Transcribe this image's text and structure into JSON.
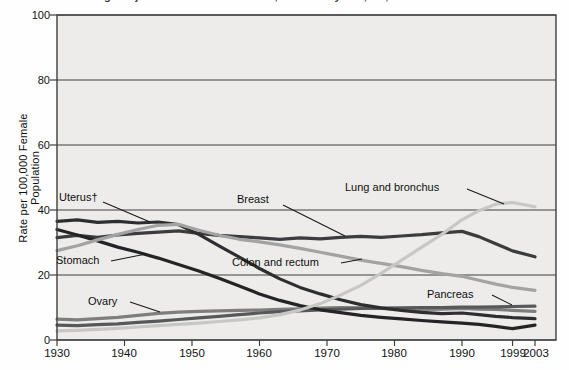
{
  "page": {
    "clipped_title": "Age-Adjusted Cancer Death Rates, Females by Site, US, 1930-2003"
  },
  "chart_data": {
    "type": "line",
    "title": "",
    "xlabel": "",
    "ylabel": "Rate per 100,000 Female Population",
    "xlim": [
      1930,
      2003
    ],
    "ylim": [
      0,
      100
    ],
    "grid": "horizontal",
    "legend_position": "inline-callouts",
    "plot_bg_color": "#edecea",
    "grid_color": "#3f3f3f",
    "x": [
      1930,
      1933,
      1936,
      1939,
      1942,
      1945,
      1948,
      1951,
      1954,
      1957,
      1960,
      1963,
      1966,
      1969,
      1972,
      1975,
      1978,
      1981,
      1984,
      1987,
      1990,
      1993,
      1996,
      1999,
      2003
    ],
    "ytick_labels": [
      "100",
      "80",
      "60",
      "40",
      "20",
      "0"
    ],
    "ytick_values": [
      100,
      80,
      60,
      40,
      20,
      0
    ],
    "xtick_labels": [
      "1930",
      "1940",
      "1950",
      "1960",
      "1970",
      "1980",
      "1990",
      "1999",
      "2003"
    ],
    "xtick_years": [
      1930,
      1940,
      1950,
      1960,
      1970,
      1980,
      1990,
      1999,
      2003
    ],
    "series": [
      {
        "name": "ovary",
        "label": "Ovary",
        "color": "#7e7e7e",
        "values": [
          6.4,
          6.2,
          6.6,
          7.0,
          7.6,
          8.2,
          8.6,
          8.8,
          9.0,
          9.1,
          9.2,
          9.4,
          9.6,
          9.8,
          10.0,
          9.9,
          9.7,
          9.5,
          9.4,
          9.5,
          9.7,
          9.5,
          9.4,
          9.1,
          8.8
        ]
      },
      {
        "name": "pancreas",
        "label": "Pancreas",
        "color": "#58585a",
        "values": [
          4.6,
          4.4,
          4.7,
          5.0,
          5.4,
          5.8,
          6.3,
          6.8,
          7.3,
          7.8,
          8.3,
          8.7,
          9.0,
          9.3,
          9.5,
          9.7,
          9.8,
          9.9,
          10.0,
          10.0,
          10.1,
          10.1,
          10.2,
          10.3,
          10.4
        ]
      },
      {
        "name": "breast",
        "label": "Breast",
        "color": "#3c3c3e",
        "values": [
          31.5,
          32.2,
          31.6,
          32.3,
          32.8,
          33.2,
          33.6,
          32.8,
          32.2,
          31.8,
          31.4,
          31.0,
          31.4,
          31.1,
          31.6,
          31.9,
          31.6,
          32.0,
          32.4,
          33.0,
          33.4,
          31.8,
          29.6,
          27.4,
          25.6
        ]
      },
      {
        "name": "uterus",
        "label": "Uterus†",
        "color": "#2e2e30",
        "values": [
          36.5,
          37.0,
          36.2,
          36.5,
          36.0,
          36.3,
          35.5,
          32.5,
          29.0,
          25.5,
          22.0,
          18.8,
          16.2,
          14.2,
          12.4,
          10.9,
          9.9,
          9.1,
          8.5,
          8.1,
          8.3,
          7.8,
          7.3,
          6.9,
          6.6
        ]
      },
      {
        "name": "stomach",
        "label": "Stomach",
        "color": "#242426",
        "values": [
          34.0,
          32.3,
          30.5,
          28.6,
          27.0,
          25.2,
          23.2,
          21.2,
          19.0,
          16.6,
          14.2,
          12.2,
          10.6,
          9.3,
          8.4,
          7.6,
          7.0,
          6.5,
          6.0,
          5.6,
          5.2,
          4.8,
          4.2,
          3.5,
          4.6
        ]
      },
      {
        "name": "colon-rectum",
        "label": "Colon and rectum",
        "color": "#a3a3a3",
        "values": [
          27.5,
          29.0,
          30.8,
          32.5,
          34.0,
          35.3,
          35.6,
          33.8,
          32.2,
          31.0,
          30.2,
          29.3,
          28.2,
          27.0,
          25.8,
          24.6,
          23.6,
          22.6,
          21.4,
          20.4,
          19.6,
          18.4,
          17.2,
          16.2,
          15.3
        ]
      },
      {
        "name": "lung-bronchus",
        "label": "Lung and bronchus",
        "color": "#c7c7c5",
        "values": [
          2.8,
          3.0,
          3.3,
          3.6,
          4.0,
          4.4,
          4.8,
          5.2,
          5.7,
          6.2,
          6.8,
          7.8,
          9.2,
          11.2,
          13.8,
          16.8,
          20.5,
          24.5,
          28.5,
          32.5,
          37.0,
          39.8,
          41.8,
          42.3,
          41.0
        ]
      }
    ]
  }
}
